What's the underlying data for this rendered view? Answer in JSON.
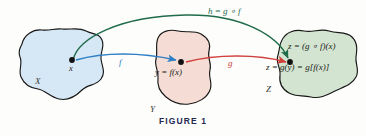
{
  "figure": {
    "caption": "FIGURE 1"
  },
  "colors": {
    "set_x_fill": "#d6e8f5",
    "set_y_fill": "#f5ddd5",
    "set_z_fill": "#d3e4d0",
    "blob_stroke": "#171717",
    "arrow_f": "#2f7fc4",
    "arrow_g": "#d0413c",
    "arrow_h": "#1f6b4a",
    "caption_color": "#232a52",
    "text_color": "#1a1a1a"
  },
  "sets": [
    {
      "id": "X",
      "label": "X",
      "fill": "#d6e8f5"
    },
    {
      "id": "Y",
      "label": "Y",
      "fill": "#f5ddd5"
    },
    {
      "id": "Z",
      "label": "Z",
      "fill": "#d3e4d0"
    }
  ],
  "points": [
    {
      "id": "x",
      "label": "x"
    },
    {
      "id": "y",
      "label": "y = f(x)"
    },
    {
      "id": "z1",
      "label": "z = (g ∘ f)(x)"
    },
    {
      "id": "z2",
      "label": "z = g(y) = g[f(x)]"
    }
  ],
  "arrows": [
    {
      "id": "f",
      "label": "f",
      "color": "#2f7fc4",
      "from": "x",
      "to": "y"
    },
    {
      "id": "g",
      "label": "g",
      "color": "#d0413c",
      "from": "y",
      "to": "z"
    },
    {
      "id": "h",
      "label": "h = g ∘ f",
      "color": "#1f6b4a",
      "from": "x",
      "to": "z"
    }
  ]
}
